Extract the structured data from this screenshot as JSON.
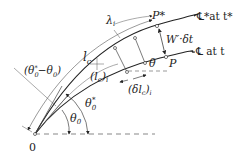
{
  "diagram": {
    "labels": {
      "origin": "0",
      "curve_outer": "℄*at t*",
      "curve_inner": "℄ at t",
      "point_outer": "P*",
      "point_inner": "P",
      "displacement": "W′·δt",
      "lambda": "λ",
      "lambda_sub": "i",
      "lc": "l",
      "lc_sub": "c",
      "lci": "(l",
      "lci_sub": "c",
      "lci_close": ")",
      "lci_sub2": "i",
      "angle_diff": "(θ",
      "angle_diff_sub": "0",
      "angle_diff_sup": "*",
      "angle_diff_mid": "−θ",
      "angle_diff_sub2": "0",
      "angle_diff_close": ")",
      "theta0": "θ",
      "theta0_sub": "0",
      "theta0star": "θ",
      "theta0star_sub": "0",
      "theta0star_sup": "*",
      "theta": "θ",
      "dlc": "(δl",
      "dlc_sub": "c",
      "dlc_close": ")",
      "dlc_sub2": "i"
    },
    "colors": {
      "stroke": "#222222",
      "thin": "#555555",
      "background": "#ffffff"
    }
  }
}
